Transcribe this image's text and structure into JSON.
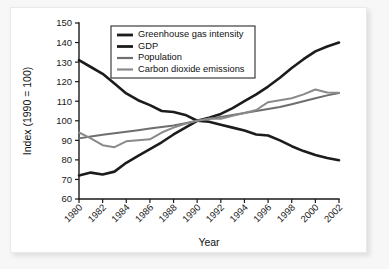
{
  "chart_data": {
    "type": "line",
    "title": "",
    "xlabel": "Year",
    "ylabel": "Index (1990 = 100)",
    "xlim": [
      1980,
      2002
    ],
    "ylim": [
      60,
      150
    ],
    "grid": false,
    "legend_position": "top-center",
    "x": [
      1980,
      1981,
      1982,
      1983,
      1984,
      1985,
      1986,
      1987,
      1988,
      1989,
      1990,
      1991,
      1992,
      1993,
      1994,
      1995,
      1996,
      1997,
      1998,
      1999,
      2000,
      2001,
      2002
    ],
    "xtick_labels": [
      "1980",
      "1982",
      "1984",
      "1986",
      "1988",
      "1990",
      "1992",
      "1994",
      "1996",
      "1998",
      "2000",
      "2002"
    ],
    "xtick_values": [
      1980,
      1982,
      1984,
      1986,
      1988,
      1990,
      1992,
      1994,
      1996,
      1998,
      2000,
      2002
    ],
    "ytick_labels": [
      "60",
      "70",
      "80",
      "90",
      "100",
      "110",
      "120",
      "130",
      "140",
      "150"
    ],
    "ytick_values": [
      60,
      70,
      80,
      90,
      100,
      110,
      120,
      130,
      140,
      150
    ],
    "series": [
      {
        "name": "Greenhouse gas intensity",
        "color": "#1c1c1c",
        "values": [
          131.0,
          127.5,
          124.0,
          119.0,
          114.0,
          110.5,
          108.0,
          105.0,
          104.5,
          103.0,
          100.0,
          99.5,
          98.0,
          96.5,
          95.0,
          93.0,
          92.5,
          90.0,
          87.0,
          84.5,
          82.5,
          81.0,
          79.8
        ]
      },
      {
        "name": "GDP",
        "color": "#1c1c1c",
        "values": [
          72.0,
          73.5,
          72.5,
          74.0,
          78.5,
          82.0,
          85.5,
          89.0,
          93.0,
          96.5,
          100.0,
          101.5,
          103.5,
          106.5,
          110.0,
          113.5,
          117.5,
          122.0,
          127.0,
          131.5,
          135.5,
          138.0,
          140.0
        ]
      },
      {
        "name": "Population",
        "color": "#6e6e6e",
        "values": [
          91.0,
          92.0,
          92.8,
          93.6,
          94.4,
          95.2,
          96.0,
          96.8,
          97.6,
          98.8,
          100.0,
          101.0,
          102.0,
          103.0,
          104.0,
          105.0,
          106.0,
          107.0,
          108.5,
          110.0,
          111.5,
          113.0,
          114.2
        ]
      },
      {
        "name": "Carbon dioxide emissions",
        "color": "#8a8a8a",
        "values": [
          94.0,
          91.0,
          87.5,
          86.5,
          89.5,
          90.0,
          90.5,
          94.0,
          96.5,
          98.5,
          100.0,
          101.0,
          101.0,
          102.5,
          104.0,
          105.5,
          109.5,
          110.5,
          111.5,
          113.5,
          116.0,
          114.5,
          114.3
        ]
      }
    ]
  }
}
